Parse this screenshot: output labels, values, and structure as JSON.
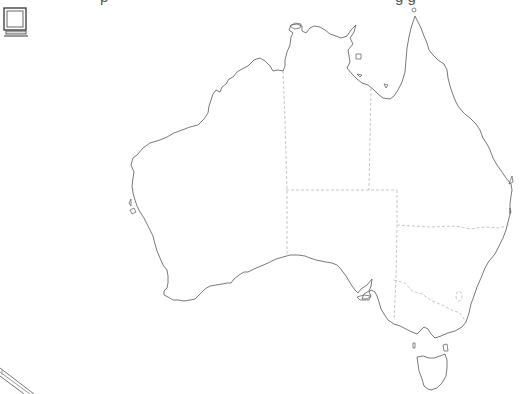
{
  "header": {
    "clipped_text_left": "p",
    "clipped_text_right": "g g"
  },
  "icons": {
    "top_left": "monitor-icon",
    "bottom_left": "pencil-icon"
  },
  "map": {
    "subject": "Australia",
    "style": "outline map with dashed state borders",
    "regions": [
      "Western Australia",
      "Northern Territory",
      "Queensland",
      "South Australia",
      "New South Wales",
      "Victoria",
      "Tasmania"
    ],
    "colors": {
      "coastline": "#6a6a6a",
      "state_border": "#b8b8b8",
      "background": "#ffffff"
    }
  }
}
